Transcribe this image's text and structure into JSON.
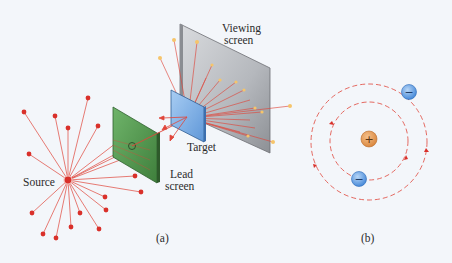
{
  "figure": {
    "panel_a": {
      "caption": "(a)",
      "labels": {
        "source": "Source",
        "lead_screen_line1": "Lead",
        "lead_screen_line2": "screen",
        "target": "Target",
        "viewing_screen_line1": "Viewing",
        "viewing_screen_line2": "screen"
      }
    },
    "panel_b": {
      "caption": "(b)",
      "nucleus_symbol": "+",
      "electron_symbol": "−"
    }
  },
  "colors": {
    "background": "#f3f6fa",
    "ray": "#e0453a",
    "source": "#d9302a",
    "lead_screen": "#4f9a4c",
    "target": "#7fb3ea",
    "viewing_screen": "#b9bcc2",
    "nucleus": "#e39a4e",
    "electron": "#5b9ae0",
    "spark": "#f6c56a"
  }
}
